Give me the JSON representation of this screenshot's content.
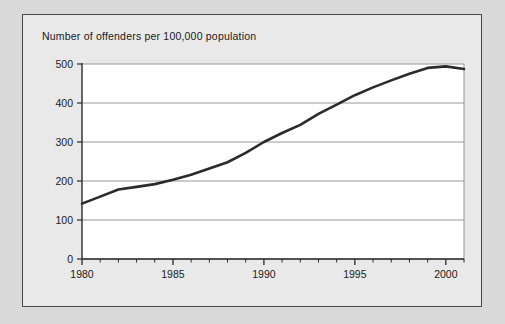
{
  "figure": {
    "background_color": "#d9d9d9",
    "panel_color": "#e9e9e9",
    "panel_border_color": "#4a4a4a",
    "plot_background_color": "#ffffff"
  },
  "chart_data": {
    "type": "line",
    "title": "Number of offenders per 100,000 population",
    "xlabel": "",
    "ylabel": "",
    "xlim": [
      1980,
      2001
    ],
    "ylim": [
      0,
      500
    ],
    "grid": true,
    "grid_axis": "y",
    "legend": false,
    "legend_position": "none",
    "line_color": "#2b2b2b",
    "line_width": 2.6,
    "y_ticks": [
      0,
      100,
      200,
      300,
      400,
      500
    ],
    "y_tick_labels": [
      "0",
      "100",
      "200",
      "300",
      "400",
      "500"
    ],
    "x_ticks": [
      1980,
      1985,
      1990,
      1995,
      2000
    ],
    "x_tick_labels": [
      "1980",
      "1985",
      "1990",
      "1995",
      "2000"
    ],
    "x_minor_tick_interval": 1,
    "x": [
      1980,
      1981,
      1982,
      1983,
      1984,
      1985,
      1986,
      1987,
      1988,
      1989,
      1990,
      1991,
      1992,
      1993,
      1994,
      1995,
      1996,
      1997,
      1998,
      1999,
      2000,
      2001
    ],
    "series": [
      {
        "name": "Offenders per 100,000 population",
        "values": [
          142,
          160,
          178,
          185,
          192,
          203,
          216,
          232,
          248,
          272,
          300,
          323,
          344,
          372,
          396,
          420,
          440,
          458,
          475,
          490,
          494,
          487
        ]
      }
    ]
  }
}
